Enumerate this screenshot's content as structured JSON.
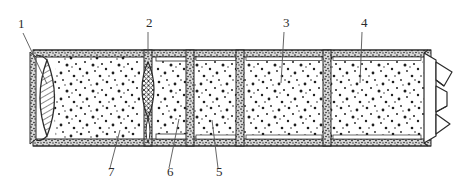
{
  "figure": {
    "domain_note": "patent-style line drawing",
    "background_color": "#ffffff",
    "line_color": "#2b2b2b",
    "fill_color": "#ffffff",
    "speckle_color": "#1f1f1f"
  },
  "callouts": [
    {
      "id": "1",
      "label": "1",
      "text_x": 18,
      "text_y": 28,
      "leader": {
        "x1": 23,
        "y1": 33,
        "x2": 47,
        "y2": 84
      },
      "target": "left-lens-closure"
    },
    {
      "id": "2",
      "label": "2",
      "text_x": 146,
      "text_y": 27,
      "leader": {
        "x1": 148,
        "y1": 32,
        "x2": 148,
        "y2": 55
      },
      "target": "crosshatched-partition"
    },
    {
      "id": "3",
      "label": "3",
      "text_x": 283,
      "text_y": 27,
      "leader": {
        "x1": 284,
        "y1": 32,
        "x2": 281,
        "y2": 83
      },
      "target": "chamber-three"
    },
    {
      "id": "4",
      "label": "4",
      "text_x": 361,
      "text_y": 27,
      "leader": {
        "x1": 362,
        "y1": 32,
        "x2": 360,
        "y2": 83
      },
      "target": "chamber-four"
    },
    {
      "id": "5",
      "label": "5",
      "text_x": 216,
      "text_y": 176,
      "leader": {
        "x1": 218,
        "y1": 168,
        "x2": 212,
        "y2": 120
      },
      "target": "chamber-two"
    },
    {
      "id": "6",
      "label": "6",
      "text_x": 167,
      "text_y": 176,
      "leader": {
        "x1": 169,
        "y1": 168,
        "x2": 179,
        "y2": 119
      },
      "target": "inner-liner-strip"
    },
    {
      "id": "7",
      "label": "7",
      "text_x": 108,
      "text_y": 176,
      "leader": {
        "x1": 110,
        "y1": 168,
        "x2": 120,
        "y2": 130
      },
      "target": "bottom-casing-wall"
    }
  ],
  "body": {
    "left_x": 30,
    "right_x": 432,
    "top_y": 50,
    "bottom_y": 145,
    "wall_thickness": 6
  },
  "partitions": [
    {
      "name": "lens-hatched-closure",
      "x": 47,
      "style": "diagonal-hatch-lens",
      "half_width": 13
    },
    {
      "name": "lens-crosshatch-divider",
      "x": 148,
      "style": "cross-hatch-lens",
      "half_width": 12
    },
    {
      "name": "plain-divider-a",
      "x": 190,
      "style": "speckle-band",
      "half_width": 4
    },
    {
      "name": "plain-divider-b",
      "x": 240,
      "style": "speckle-band",
      "half_width": 4
    },
    {
      "name": "plain-divider-c",
      "x": 327,
      "style": "speckle-band",
      "half_width": 4
    }
  ],
  "chambers": [
    {
      "name": "chamber-one",
      "x_start": 56,
      "x_end": 140
    },
    {
      "name": "chamber-two",
      "x_start": 156,
      "x_end": 186
    },
    {
      "name": "chamber-three",
      "x_start": 194,
      "x_end": 236
    },
    {
      "name": "chamber-four",
      "x_start": 244,
      "x_end": 323
    },
    {
      "name": "chamber-five",
      "x_start": 331,
      "x_end": 424
    }
  ],
  "end_closures": {
    "left": {
      "name": "lens-end-closure",
      "type": "hatched-lens"
    },
    "right": {
      "name": "twisted-end-closure",
      "type": "gathered-twist"
    }
  }
}
